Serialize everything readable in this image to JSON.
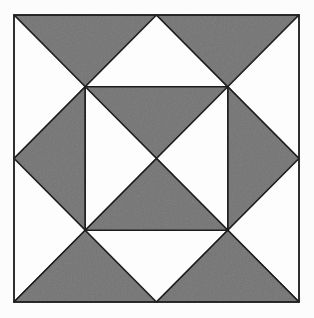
{
  "figure": {
    "canvas": {
      "width": 314,
      "height": 318
    },
    "square": {
      "left": 14,
      "top": 15,
      "right": 299,
      "bottom": 302
    },
    "colors": {
      "shaded": "#828282",
      "unshaded": "#fdfdfd",
      "outline": "#222222",
      "background": "#fcfcfc"
    },
    "stroke_width": 1.5,
    "grid_unit": 0.25,
    "counts": {
      "shaded_triangles": 8,
      "unshaded_triangles": 8
    },
    "triangles": [
      {
        "fill": "shaded",
        "points": [
          [
            0,
            0
          ],
          [
            0.5,
            0
          ],
          [
            0.25,
            0.25
          ]
        ]
      },
      {
        "fill": "unshaded",
        "points": [
          [
            0.5,
            0
          ],
          [
            0.75,
            0.25
          ],
          [
            0.25,
            0.25
          ]
        ]
      },
      {
        "fill": "shaded",
        "points": [
          [
            0.5,
            0
          ],
          [
            1,
            0
          ],
          [
            0.75,
            0.25
          ]
        ]
      },
      {
        "fill": "unshaded",
        "points": [
          [
            0,
            0
          ],
          [
            0.25,
            0.25
          ],
          [
            0,
            0.5
          ]
        ]
      },
      {
        "fill": "shaded",
        "points": [
          [
            0,
            0.5
          ],
          [
            0.25,
            0.25
          ],
          [
            0.25,
            0.75
          ]
        ]
      },
      {
        "fill": "unshaded",
        "points": [
          [
            0,
            0.5
          ],
          [
            0.25,
            0.75
          ],
          [
            0,
            1
          ]
        ]
      },
      {
        "fill": "unshaded",
        "points": [
          [
            1,
            0
          ],
          [
            1,
            0.5
          ],
          [
            0.75,
            0.25
          ]
        ]
      },
      {
        "fill": "shaded",
        "points": [
          [
            1,
            0.5
          ],
          [
            0.75,
            0.25
          ],
          [
            0.75,
            0.75
          ]
        ]
      },
      {
        "fill": "unshaded",
        "points": [
          [
            1,
            0.5
          ],
          [
            1,
            1
          ],
          [
            0.75,
            0.75
          ]
        ]
      },
      {
        "fill": "shaded",
        "points": [
          [
            0,
            1
          ],
          [
            0.25,
            0.75
          ],
          [
            0.5,
            1
          ]
        ]
      },
      {
        "fill": "unshaded",
        "points": [
          [
            0.5,
            1
          ],
          [
            0.25,
            0.75
          ],
          [
            0.75,
            0.75
          ]
        ]
      },
      {
        "fill": "shaded",
        "points": [
          [
            0.5,
            1
          ],
          [
            0.75,
            0.75
          ],
          [
            1,
            1
          ]
        ]
      },
      {
        "fill": "shaded",
        "points": [
          [
            0.25,
            0.25
          ],
          [
            0.75,
            0.25
          ],
          [
            0.5,
            0.5
          ]
        ]
      },
      {
        "fill": "unshaded",
        "points": [
          [
            0.25,
            0.25
          ],
          [
            0.5,
            0.5
          ],
          [
            0.25,
            0.75
          ]
        ]
      },
      {
        "fill": "unshaded",
        "points": [
          [
            0.75,
            0.25
          ],
          [
            0.5,
            0.5
          ],
          [
            0.75,
            0.75
          ]
        ]
      },
      {
        "fill": "shaded",
        "points": [
          [
            0.25,
            0.75
          ],
          [
            0.5,
            0.5
          ],
          [
            0.75,
            0.75
          ]
        ]
      }
    ]
  }
}
